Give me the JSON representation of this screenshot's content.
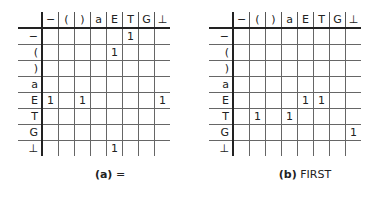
{
  "symbols": [
    "−",
    "(",
    ")",
    "a",
    "E",
    "T",
    "G",
    "⊥"
  ],
  "tables": [
    {
      "caption_label": "(a)",
      "caption_text": "=",
      "rows": [
        [
          "",
          "",
          "",
          "",
          "",
          "1",
          "",
          ""
        ],
        [
          "",
          "",
          "",
          "",
          "1",
          "",
          "",
          ""
        ],
        [
          "",
          "",
          "",
          "",
          "",
          "",
          "",
          ""
        ],
        [
          "",
          "",
          "",
          "",
          "",
          "",
          "",
          ""
        ],
        [
          "1",
          "",
          "1",
          "",
          "",
          "",
          "",
          "1"
        ],
        [
          "",
          "",
          "",
          "",
          "",
          "",
          "",
          ""
        ],
        [
          "",
          "",
          "",
          "",
          "",
          "",
          "",
          ""
        ],
        [
          "",
          "",
          "",
          "",
          "1",
          "",
          "",
          ""
        ]
      ]
    },
    {
      "caption_label": "(b)",
      "caption_text": "FIRST",
      "rows": [
        [
          "",
          "",
          "",
          "",
          "",
          "",
          "",
          ""
        ],
        [
          "",
          "",
          "",
          "",
          "",
          "",
          "",
          ""
        ],
        [
          "",
          "",
          "",
          "",
          "",
          "",
          "",
          ""
        ],
        [
          "",
          "",
          "",
          "",
          "",
          "",
          "",
          ""
        ],
        [
          "",
          "",
          "",
          "",
          "1",
          "1",
          "",
          ""
        ],
        [
          "",
          "1",
          "",
          "1",
          "",
          "",
          "",
          ""
        ],
        [
          "",
          "",
          "",
          "",
          "",
          "",
          "",
          "1"
        ],
        [
          "",
          "",
          "",
          "",
          "",
          "",
          "",
          ""
        ]
      ]
    }
  ]
}
